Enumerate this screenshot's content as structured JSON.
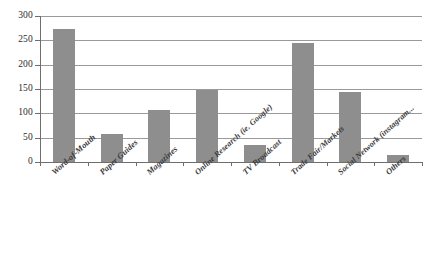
{
  "chart_data": {
    "type": "bar",
    "title": "",
    "subtitle": "",
    "xlabel": "",
    "ylabel": "",
    "ylim": [
      0,
      300
    ],
    "ytick_values": [
      0,
      50,
      100,
      150,
      200,
      250,
      300
    ],
    "ytick_labels": [
      "0",
      "50",
      "100",
      "150",
      "200",
      "250",
      "300"
    ],
    "grid": true,
    "grid_axis": "y",
    "legend": false,
    "legend_position": "none",
    "bar_color": "#8e8e8e",
    "categories": [
      "Word-of-Mouth",
      "Paper Guides",
      "Magazines",
      "Online Research (ie. Google)",
      "TV Broadcast",
      "Trade Fair/Markets",
      "Social Network (instagram...",
      "Others"
    ],
    "values": [
      273,
      58,
      107,
      147,
      35,
      245,
      143,
      14
    ]
  },
  "colors": {
    "bar": "#8e8e8e",
    "gridline": "#9a9a9a",
    "axis": "#6e6e6e",
    "text": "#2b2b2b",
    "label_text": "#3a3a3a",
    "background": "#ffffff"
  }
}
